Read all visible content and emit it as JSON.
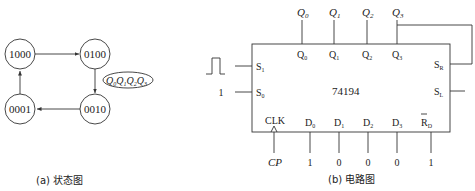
{
  "state_diagram": {
    "caption": "(a) 状态图",
    "states": [
      "1000",
      "0100",
      "0010",
      "0001"
    ],
    "legend": {
      "q0": "Q",
      "s0": "0",
      "s1": "1",
      "s2": "2",
      "s3": "3"
    },
    "transitions": [
      {
        "from": "1000",
        "to": "0100"
      },
      {
        "from": "0100",
        "to": "0010"
      },
      {
        "from": "0010",
        "to": "0001"
      },
      {
        "from": "0001",
        "to": "1000"
      }
    ]
  },
  "circuit": {
    "caption": "(b) 电路图",
    "chip": "74194",
    "outputs_ext": [
      {
        "l": "Q",
        "s": "0"
      },
      {
        "l": "Q",
        "s": "1"
      },
      {
        "l": "Q",
        "s": "2"
      },
      {
        "l": "Q",
        "s": "3"
      }
    ],
    "outputs_pin": [
      {
        "l": "Q",
        "s": "0"
      },
      {
        "l": "Q",
        "s": "1"
      },
      {
        "l": "Q",
        "s": "2"
      },
      {
        "l": "Q",
        "s": "3"
      }
    ],
    "left_pins": [
      {
        "l": "S",
        "s": "1",
        "input": "pulse"
      },
      {
        "l": "S",
        "s": "0",
        "input": "1"
      }
    ],
    "right_pins": [
      {
        "l": "S",
        "s": "R"
      },
      {
        "l": "S",
        "s": "L"
      }
    ],
    "bottom_pins": [
      {
        "l": "CLK",
        "s": "",
        "input": "CP"
      },
      {
        "l": "D",
        "s": "0",
        "input": "1"
      },
      {
        "l": "D",
        "s": "1",
        "input": "0"
      },
      {
        "l": "D",
        "s": "2",
        "input": "0"
      },
      {
        "l": "D",
        "s": "3",
        "input": "0"
      },
      {
        "l": "R",
        "s": "D",
        "input": "1"
      }
    ],
    "s0_value": "1",
    "cp_label": "CP"
  }
}
